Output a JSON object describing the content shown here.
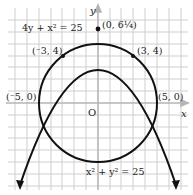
{
  "diagram": {
    "axes": {
      "x_label": "x",
      "y_label": "y",
      "origin_label": "O"
    },
    "curves": {
      "parabola": {
        "equation": "4y + x² = 25"
      },
      "circle": {
        "equation": "x² + y² = 25"
      }
    },
    "points": [
      {
        "label": "(0, 6¼)",
        "x": 0,
        "y": 6.25
      },
      {
        "label": "(⁻3, 4)",
        "x": -3,
        "y": 4
      },
      {
        "label": "(3, 4)",
        "x": 3,
        "y": 4
      },
      {
        "label": "(⁻5, 0)",
        "x": -5,
        "y": 0
      },
      {
        "label": "(5, 0)",
        "x": 5,
        "y": 0
      }
    ],
    "colors": {
      "grid": "#c8c8c8",
      "axis": "#bdbdbd",
      "curve": "#111111"
    }
  }
}
